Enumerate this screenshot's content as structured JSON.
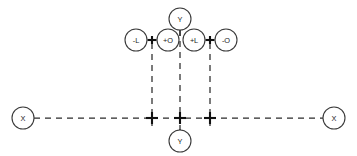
{
  "diagram": {
    "title": "",
    "canvas": {
      "width": 357,
      "height": 156
    },
    "colors": {
      "background": "#ffffff",
      "stroke": "#2b2b2b",
      "node_stroke": "#3a3a3a",
      "node_fill": "#ffffff",
      "label": "#1d1d1d",
      "junction": "#111111"
    },
    "nodes": [
      {
        "id": "y-top",
        "label": "Y",
        "cx": 180,
        "cy": 19,
        "r": 11
      },
      {
        "id": "minus-l",
        "label": "-L",
        "cx": 136,
        "cy": 40,
        "r": 11
      },
      {
        "id": "plus-o",
        "label": "+O",
        "cx": 168,
        "cy": 40,
        "r": 11
      },
      {
        "id": "plus-l",
        "label": "+L",
        "cx": 194,
        "cy": 40,
        "r": 11
      },
      {
        "id": "minus-o",
        "label": "-O",
        "cx": 226,
        "cy": 40,
        "r": 11
      },
      {
        "id": "x-left",
        "label": "X",
        "cx": 23,
        "cy": 118,
        "r": 11
      },
      {
        "id": "x-right",
        "label": "X",
        "cx": 334,
        "cy": 118,
        "r": 11
      },
      {
        "id": "y-bottom",
        "label": "Y",
        "cx": 180,
        "cy": 141,
        "r": 11
      }
    ],
    "junctions": [
      {
        "id": "j-upper-left",
        "x": 152,
        "y": 40,
        "style": "cross"
      },
      {
        "id": "j-upper-right",
        "x": 210,
        "y": 40,
        "style": "cross"
      },
      {
        "id": "j-bus-left",
        "x": 152,
        "y": 118,
        "style": "cross"
      },
      {
        "id": "j-bus-center",
        "x": 180,
        "y": 118,
        "style": "cross"
      },
      {
        "id": "j-bus-right",
        "x": 210,
        "y": 118,
        "style": "cross"
      }
    ],
    "links": [
      {
        "id": "link-minus-l-junction",
        "style": "solid",
        "from": "-L",
        "to": "junction-left"
      },
      {
        "id": "link-junction-plus-o",
        "style": "solid",
        "from": "junction-left",
        "to": "+O"
      },
      {
        "id": "link-plus-l-junction",
        "style": "solid",
        "from": "+L",
        "to": "junction-right"
      },
      {
        "id": "link-junction-minus-o",
        "style": "solid",
        "from": "junction-right",
        "to": "-O"
      },
      {
        "id": "link-y-top-bus",
        "style": "dashed",
        "from": "Y",
        "to": "bus-center"
      },
      {
        "id": "link-y-bottom-bus",
        "style": "dashed",
        "from": "Y",
        "to": "bus-center"
      },
      {
        "id": "link-left-drop",
        "style": "dashed",
        "from": "junction-left",
        "to": "bus-left"
      },
      {
        "id": "link-right-drop",
        "style": "dashed",
        "from": "junction-right",
        "to": "bus-right"
      },
      {
        "id": "link-x-left-bus",
        "style": "dashed",
        "from": "X",
        "to": "bus-left"
      },
      {
        "id": "link-bus-middle",
        "style": "dashed",
        "from": "bus-left",
        "to": "bus-right"
      },
      {
        "id": "link-bus-x-right",
        "style": "dashed",
        "from": "bus-right",
        "to": "X"
      }
    ]
  }
}
